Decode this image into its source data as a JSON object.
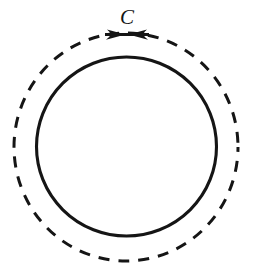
{
  "figure": {
    "kind": "math-diagram",
    "background_color": "#ffffff",
    "ink_color": "#151515",
    "canvas": {
      "width": 253,
      "height": 273
    },
    "labels": [
      {
        "id": "contour-label-c",
        "text": "C",
        "style": "italic-serif",
        "font_size": 21,
        "x": 127,
        "y": 24,
        "color": "#151515"
      }
    ],
    "shapes": {
      "inner_circle": {
        "name": "solid-inner-circle",
        "role": "singularity-boundary",
        "stroke_style": "solid",
        "center_x": 126.5,
        "center_y": 146.5,
        "radius_x": 90,
        "radius_y": 89.5,
        "stroke_width": 3.1,
        "color": "#151515"
      },
      "outer_circle": {
        "name": "dashed-contour-circle",
        "role": "integration-contour",
        "stroke_style": "dashed",
        "center_x": 126,
        "center_y": 147,
        "radius_x": 112,
        "radius_y": 114,
        "stroke_width": 3.0,
        "dash_length": 11,
        "gap_length": 9,
        "color": "#151515"
      }
    },
    "arrows": [
      {
        "id": "orientation-arrow-left",
        "name": "arrowhead-right-pointing",
        "direction": "clockwise-right",
        "tip_x": 127,
        "tip_y": 34.5,
        "size": 10,
        "color": "#151515"
      },
      {
        "id": "orientation-arrow-right",
        "name": "arrowhead-left-pointing",
        "direction": "counterclockwise-left",
        "tip_x": 127,
        "tip_y": 34.5,
        "size": 10,
        "color": "#151515"
      }
    ]
  }
}
